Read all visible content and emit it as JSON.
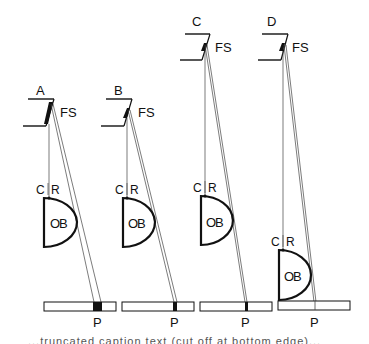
{
  "figure": {
    "panels": [
      {
        "id": "A",
        "label": "A",
        "field_stop_label": "FS",
        "center_ray_label": "C",
        "ray_label": "R",
        "objective_label": "OB",
        "projection_label": "P"
      },
      {
        "id": "B",
        "label": "B",
        "field_stop_label": "FS",
        "center_ray_label": "C",
        "ray_label": "R",
        "objective_label": "OB",
        "projection_label": "P"
      },
      {
        "id": "C",
        "label": "C",
        "field_stop_label": "FS",
        "center_ray_label": "C",
        "ray_label": "R",
        "objective_label": "OB",
        "projection_label": "P"
      },
      {
        "id": "D",
        "label": "D",
        "field_stop_label": "FS",
        "center_ray_label": "C",
        "ray_label": "R",
        "objective_label": "OB",
        "projection_label": "P"
      }
    ],
    "colors": {
      "ink": "#111111",
      "ray": "#555555",
      "background": "#ffffff"
    }
  },
  "caption": {
    "text": "...truncated caption text (cut off at bottom edge)..."
  }
}
